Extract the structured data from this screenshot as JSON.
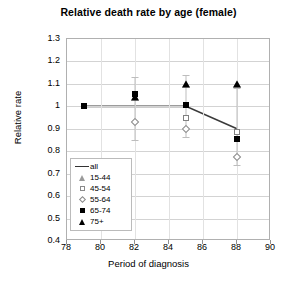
{
  "chart_data": {
    "type": "scatter",
    "title": "Relative death rate by age (female)",
    "xlabel": "Period of diagnosis",
    "ylabel": "Relative rate",
    "xlim": [
      78,
      90
    ],
    "ylim": [
      0.4,
      1.3
    ],
    "xticks": [
      78,
      80,
      82,
      84,
      86,
      88,
      90
    ],
    "yticks": [
      0.4,
      0.5,
      0.6,
      0.7,
      0.8,
      0.9,
      1,
      1.1,
      1.2,
      1.3
    ],
    "grid": true,
    "legend_position": "inside-lower-left",
    "legend": [
      "all",
      "15-44",
      "45-54",
      "55-64",
      "65-74",
      "75+"
    ],
    "series": [
      {
        "name": "all",
        "marker": "line",
        "x": [
          79,
          82,
          85,
          88
        ],
        "values": [
          1.0,
          1.0,
          1.0,
          0.9
        ]
      },
      {
        "name": "15-44",
        "marker": "open-triangle",
        "x": [
          82,
          85,
          88
        ],
        "values": [
          1.04,
          1.1,
          1.1
        ]
      },
      {
        "name": "45-54",
        "marker": "open-square",
        "x": [
          85,
          88
        ],
        "values": [
          0.95,
          0.885
        ]
      },
      {
        "name": "55-64",
        "marker": "open-diamond",
        "x": [
          82,
          85,
          88
        ],
        "values": [
          0.93,
          0.9,
          0.775
        ]
      },
      {
        "name": "65-74",
        "marker": "filled-square",
        "x": [
          79,
          82,
          85,
          88
        ],
        "values": [
          1.0,
          1.055,
          1.005,
          0.855
        ]
      },
      {
        "name": "75+",
        "marker": "filled-triangle",
        "x": [
          82,
          85,
          88
        ],
        "values": [
          1.04,
          1.1,
          1.1
        ]
      }
    ],
    "error_bars": [
      {
        "x": 82,
        "low": 0.85,
        "high": 1.13
      },
      {
        "x": 85,
        "low": 0.865,
        "high": 1.14
      },
      {
        "x": 88,
        "low": 0.74,
        "high": 1.08
      }
    ]
  }
}
